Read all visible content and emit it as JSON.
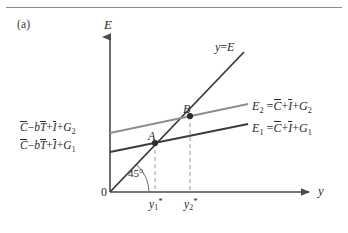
{
  "figure": {
    "panel_label": "(a)",
    "colors": {
      "axis": "#4a4a4a",
      "line_45": "#3a3a3a",
      "line_E1": "#3c3c3c",
      "line_E2": "#8e8e8e",
      "dashed": "#9a9a9a",
      "point": "#2b2b2b",
      "rule": "#8d8d8d",
      "text": "#2b2b2b"
    }
  },
  "axes": {
    "y_axis_label": "E",
    "x_axis_label": "y",
    "origin_label": "0",
    "angle_label": "45°"
  },
  "lines": [
    {
      "name": "forty-five-degree-line",
      "label_parts": {
        "lhs": "y",
        "eq": "=",
        "rhs": "E"
      }
    },
    {
      "name": "expenditure-line-2",
      "label_parts": {
        "lhs": "E",
        "lhs_sub": "2",
        "eq": "=",
        "t1": "C",
        "op1": "+",
        "t2": "I",
        "op2": "+",
        "t3": "G",
        "t3_sub": "2"
      }
    },
    {
      "name": "expenditure-line-1",
      "label_parts": {
        "lhs": "E",
        "lhs_sub": "1",
        "eq": "=",
        "t1": "C",
        "op1": "+",
        "t2": "I",
        "op2": "+",
        "t3": "G",
        "t3_sub": "1"
      }
    }
  ],
  "intercepts": [
    {
      "name": "intercept-2",
      "t1": "C",
      "op1": "−",
      "b": "b",
      "t2": "T",
      "op2": "+",
      "t3": "I",
      "op3": "+",
      "t4": "G",
      "t4_sub": "2"
    },
    {
      "name": "intercept-1",
      "t1": "C",
      "op1": "−",
      "b": "b",
      "t2": "T",
      "op2": "+",
      "t3": "I",
      "op3": "+",
      "t4": "G",
      "t4_sub": "1"
    }
  ],
  "points": [
    {
      "name": "point-A",
      "label": "A"
    },
    {
      "name": "point-B",
      "label": "B"
    }
  ],
  "x_ticks": [
    {
      "name": "tick-y1",
      "base": "y",
      "sub": "1",
      "star": "*"
    },
    {
      "name": "tick-y2",
      "base": "y",
      "sub": "2",
      "star": "*"
    }
  ]
}
